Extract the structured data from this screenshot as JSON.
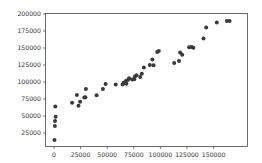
{
  "chart_data": {
    "type": "scatter",
    "title": "",
    "xlabel": "",
    "ylabel": "",
    "xlim": [
      -8000,
      180000
    ],
    "ylim": [
      -5000,
      200000
    ],
    "grid": false,
    "legend": null,
    "marker_color": "#3a3a3a",
    "x_ticks": [
      0,
      25000,
      50000,
      75000,
      100000,
      125000,
      150000
    ],
    "x_tick_labels": [
      "0",
      "25000",
      "50000",
      "75000",
      "100000",
      "125000",
      "150000"
    ],
    "y_ticks": [
      25000,
      50000,
      75000,
      100000,
      125000,
      150000,
      175000,
      200000
    ],
    "y_tick_labels": [
      "25000",
      "50000",
      "75000",
      "100000",
      "125000",
      "150000",
      "175000",
      "200000"
    ],
    "points": [
      {
        "x": 500,
        "y": 14500
      },
      {
        "x": 800,
        "y": 35500
      },
      {
        "x": 900,
        "y": 42500
      },
      {
        "x": 1500,
        "y": 49000
      },
      {
        "x": 1200,
        "y": 64000
      },
      {
        "x": 17000,
        "y": 69500
      },
      {
        "x": 21500,
        "y": 81000
      },
      {
        "x": 23000,
        "y": 65000
      },
      {
        "x": 24500,
        "y": 71000
      },
      {
        "x": 28500,
        "y": 77000
      },
      {
        "x": 29500,
        "y": 77500
      },
      {
        "x": 30000,
        "y": 89500
      },
      {
        "x": 40000,
        "y": 80500
      },
      {
        "x": 46000,
        "y": 89500
      },
      {
        "x": 48500,
        "y": 97000
      },
      {
        "x": 58000,
        "y": 96500
      },
      {
        "x": 64500,
        "y": 96500
      },
      {
        "x": 65500,
        "y": 99000
      },
      {
        "x": 67500,
        "y": 101500
      },
      {
        "x": 68000,
        "y": 97500
      },
      {
        "x": 69500,
        "y": 103000
      },
      {
        "x": 70500,
        "y": 105500
      },
      {
        "x": 73500,
        "y": 103500
      },
      {
        "x": 75500,
        "y": 104000
      },
      {
        "x": 76000,
        "y": 108000
      },
      {
        "x": 77500,
        "y": 110000
      },
      {
        "x": 81000,
        "y": 107500
      },
      {
        "x": 82500,
        "y": 112000
      },
      {
        "x": 84500,
        "y": 121500
      },
      {
        "x": 90000,
        "y": 125000
      },
      {
        "x": 92500,
        "y": 133000
      },
      {
        "x": 93500,
        "y": 124500
      },
      {
        "x": 97000,
        "y": 144000
      },
      {
        "x": 98500,
        "y": 145500
      },
      {
        "x": 113000,
        "y": 128000
      },
      {
        "x": 117500,
        "y": 131000
      },
      {
        "x": 118500,
        "y": 143500
      },
      {
        "x": 120500,
        "y": 140000
      },
      {
        "x": 127000,
        "y": 151000
      },
      {
        "x": 129500,
        "y": 151500
      },
      {
        "x": 131000,
        "y": 150500
      },
      {
        "x": 140500,
        "y": 164000
      },
      {
        "x": 143000,
        "y": 180000
      },
      {
        "x": 153000,
        "y": 187500
      },
      {
        "x": 162500,
        "y": 189500
      },
      {
        "x": 165000,
        "y": 189500
      }
    ]
  }
}
